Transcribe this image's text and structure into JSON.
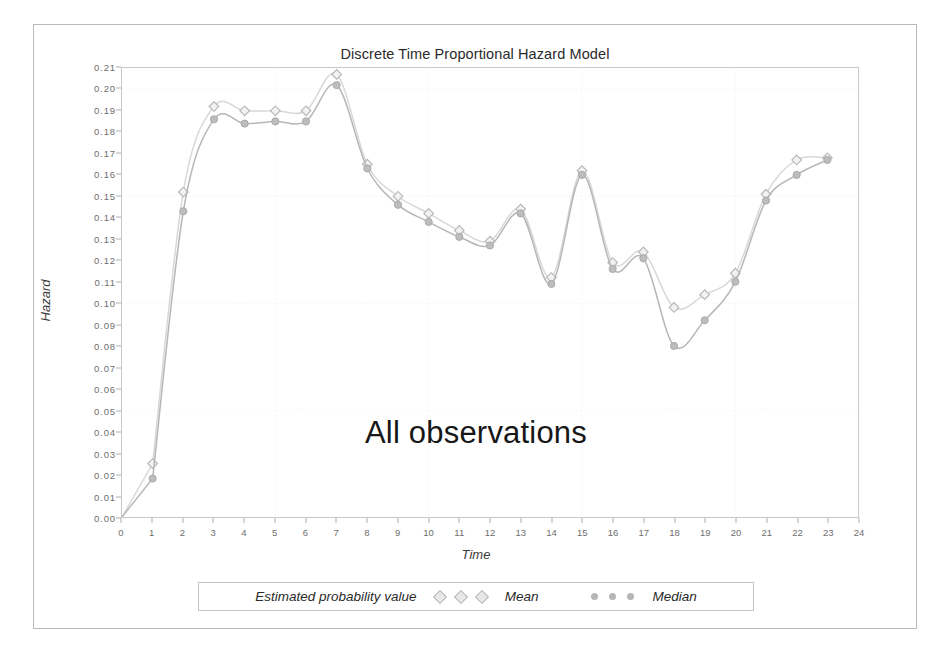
{
  "chart_data": {
    "type": "line",
    "title": "Discrete Time Proportional Hazard Model",
    "xlabel": "Time",
    "ylabel": "Hazard",
    "annotation": "All observations",
    "xlim": [
      0,
      24
    ],
    "ylim": [
      0.0,
      0.21
    ],
    "xticks": [
      "0",
      "1",
      "2",
      "3",
      "4",
      "5",
      "6",
      "7",
      "8",
      "9",
      "10",
      "11",
      "12",
      "13",
      "14",
      "15",
      "16",
      "17",
      "18",
      "19",
      "20",
      "21",
      "22",
      "23",
      "24"
    ],
    "yticks": [
      "0.00",
      "0.01",
      "0.02",
      "0.03",
      "0.04",
      "0.05",
      "0.06",
      "0.07",
      "0.08",
      "0.09",
      "0.10",
      "0.11",
      "0.12",
      "0.13",
      "0.14",
      "0.15",
      "0.16",
      "0.17",
      "0.18",
      "0.19",
      "0.20",
      "0.21"
    ],
    "grid": true,
    "legend_position": "bottom",
    "legend_title": "Estimated probability value",
    "x": [
      1,
      2,
      3,
      4,
      5,
      6,
      7,
      8,
      9,
      10,
      11,
      12,
      13,
      14,
      15,
      16,
      17,
      18,
      19,
      20,
      21,
      22,
      23
    ],
    "series": [
      {
        "name": "Mean",
        "marker": "open-diamond",
        "color": "#d8d8d8",
        "values": [
          0.025,
          0.152,
          0.192,
          0.19,
          0.19,
          0.19,
          0.207,
          0.165,
          0.15,
          0.142,
          0.134,
          0.129,
          0.144,
          0.112,
          0.162,
          0.119,
          0.124,
          0.098,
          0.104,
          0.114,
          0.151,
          0.167,
          0.168
        ]
      },
      {
        "name": "Median",
        "marker": "filled-circle",
        "color": "#b6b6b6",
        "values": [
          0.018,
          0.143,
          0.186,
          0.184,
          0.185,
          0.185,
          0.202,
          0.163,
          0.146,
          0.138,
          0.131,
          0.127,
          0.142,
          0.109,
          0.16,
          0.116,
          0.121,
          0.08,
          0.092,
          0.11,
          0.148,
          0.16,
          0.167
        ]
      }
    ]
  },
  "legend": {
    "title": "Estimated probability value",
    "mean_label": "Mean",
    "median_label": "Median"
  }
}
